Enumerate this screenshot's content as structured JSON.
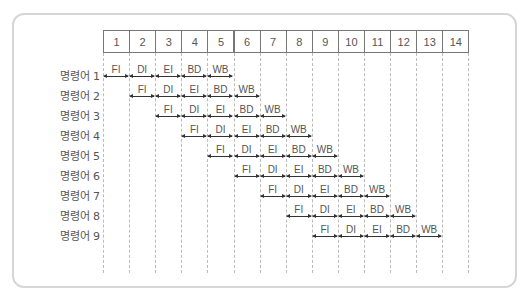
{
  "diagram": {
    "type": "instruction-pipeline-timing",
    "clock_cycles": [
      "1",
      "2",
      "3",
      "4",
      "5",
      "6",
      "7",
      "8",
      "9",
      "10",
      "11",
      "12",
      "13",
      "14"
    ],
    "stages": [
      "FI",
      "DI",
      "EI",
      "BD",
      "WB"
    ],
    "instructions": [
      {
        "label": "명령어 1",
        "start_cycle": 1
      },
      {
        "label": "명령어 2",
        "start_cycle": 2
      },
      {
        "label": "명령어 3",
        "start_cycle": 3
      },
      {
        "label": "명령어 4",
        "start_cycle": 4
      },
      {
        "label": "명령어 5",
        "start_cycle": 5
      },
      {
        "label": "명령어 6",
        "start_cycle": 6
      },
      {
        "label": "명령어 7",
        "start_cycle": 7
      },
      {
        "label": "명령어 8",
        "start_cycle": 8
      },
      {
        "label": "명령어 9",
        "start_cycle": 9
      }
    ]
  }
}
